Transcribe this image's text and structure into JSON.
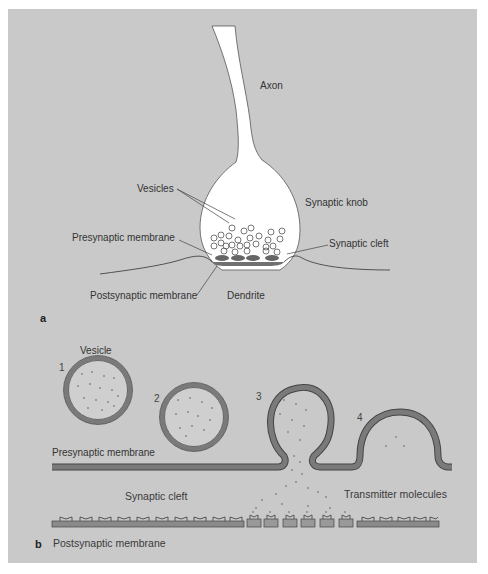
{
  "figure": {
    "part_a": {
      "letter": "a",
      "labels": {
        "axon": "Axon",
        "vesicles": "Vesicles",
        "synaptic_knob": "Synaptic knob",
        "presynaptic_membrane": "Presynaptic membrane",
        "synaptic_cleft": "Synaptic cleft",
        "postsynaptic_membrane": "Postsynaptic membrane",
        "dendrite": "Dendrite"
      }
    },
    "part_b": {
      "letter": "b",
      "stages": [
        "1",
        "2",
        "3",
        "4"
      ],
      "labels": {
        "vesicle": "Vesicle",
        "presynaptic_membrane": "Presynaptic membrane",
        "synaptic_cleft": "Synaptic cleft",
        "transmitter_molecules": "Transmitter molecules",
        "postsynaptic_membrane": "Postsynaptic membrane"
      }
    },
    "colors": {
      "background": "#c9c9c9",
      "membrane": "#7a7a7a",
      "membrane_edge": "#444444",
      "dots": "#8a8a8a",
      "knob_fill": "#ffffff"
    }
  }
}
